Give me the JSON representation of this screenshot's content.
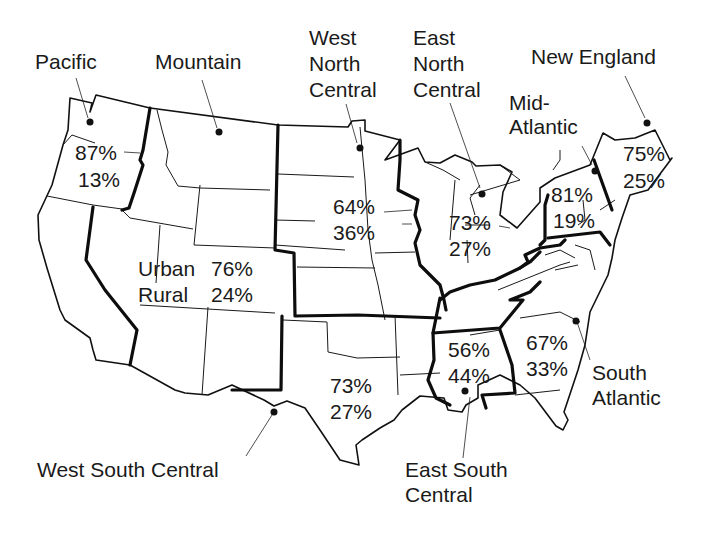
{
  "map": {
    "title": "",
    "subject": "Urban and rural population share by US Census division",
    "legend": {
      "urban_label": "Urban",
      "rural_label": "Rural"
    },
    "regions": [
      {
        "id": "pacific",
        "name_lines": [
          "Pacific"
        ],
        "urban": "87%",
        "rural": "13%"
      },
      {
        "id": "mountain",
        "name_lines": [
          "Mountain"
        ],
        "urban": "76%",
        "rural": "24%"
      },
      {
        "id": "west-north-central",
        "name_lines": [
          "West",
          "North",
          "Central"
        ],
        "urban": "64%",
        "rural": "36%"
      },
      {
        "id": "east-north-central",
        "name_lines": [
          "East",
          "North",
          "Central"
        ],
        "urban": "73%",
        "rural": "27%"
      },
      {
        "id": "mid-atlantic",
        "name_lines": [
          "Mid-",
          "Atlantic"
        ],
        "urban": "81%",
        "rural": "19%"
      },
      {
        "id": "new-england",
        "name_lines": [
          "New England"
        ],
        "urban": "75%",
        "rural": "25%"
      },
      {
        "id": "west-south-central",
        "name_lines": [
          "West South Central"
        ],
        "urban": "73%",
        "rural": "27%"
      },
      {
        "id": "east-south-central",
        "name_lines": [
          "East South",
          "Central"
        ],
        "urban": "56%",
        "rural": "44%"
      },
      {
        "id": "south-atlantic",
        "name_lines": [
          "South",
          "Atlantic"
        ],
        "urban": "67%",
        "rural": "33%"
      }
    ]
  }
}
